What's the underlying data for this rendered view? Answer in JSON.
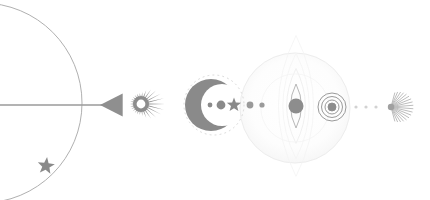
{
  "canvas": {
    "width": 430,
    "height": 200,
    "background": "#ffffff",
    "title": "Celestial Alignment Diagram",
    "baseline_y": 105
  },
  "palette": {
    "ink": "#8a8a8a",
    "ink_dark": "#7b7b7b",
    "ink_mid": "#9a9a9a",
    "ink_light": "#bdbdbd",
    "ink_faint": "#d8d8d8",
    "ink_ghost": "#ececec",
    "ink_whisper": "#f4f4f4",
    "background": "#ffffff"
  },
  "elements": [
    {
      "id": "orbit-arc",
      "name": "orbit-arc",
      "label": "Large orbital arc",
      "type": "circle-outline",
      "cx": -18,
      "cy": 103,
      "r": 100,
      "stroke": "#b0b0b0",
      "stroke_width": 1
    },
    {
      "id": "orbit-star",
      "name": "orbit-star",
      "label": "Star on orbit",
      "type": "star",
      "cx": 46,
      "cy": 166,
      "r": 9,
      "points": 5,
      "fill": "#8a8a8a"
    },
    {
      "id": "sight-line",
      "name": "sight-line",
      "label": "Horizontal sight line",
      "type": "line",
      "x1": 0,
      "y1": 105,
      "x2": 108,
      "y2": 105,
      "stroke": "#9a9a9a",
      "stroke_width": 1.6
    },
    {
      "id": "pointer-triangle",
      "name": "pointer-triangle",
      "label": "Left-pointing triangle marker",
      "type": "triangle",
      "cx": 114,
      "cy": 105,
      "size": 14,
      "direction": "left",
      "fill": "#8f8f8f"
    },
    {
      "id": "sunburst",
      "name": "sunburst-icon",
      "label": "Radiating sun",
      "type": "burst",
      "cx": 141,
      "cy": 104,
      "inner_r": 8,
      "hole_r": 4.4,
      "rays": 26,
      "ray_short": 11,
      "ray_long": 24,
      "fill": "#8d8d8d"
    },
    {
      "id": "crescent-halo",
      "name": "crescent-halo",
      "label": "Dotted halo around crescent",
      "type": "dotted-circle",
      "cx": 214,
      "cy": 105,
      "r": 30,
      "stroke": "#d8d8d8"
    },
    {
      "id": "crescent-moon",
      "name": "crescent-moon-icon",
      "label": "Crescent moon",
      "type": "crescent",
      "cx": 211,
      "cy": 105,
      "r": 26,
      "cut_cx": 222,
      "cut_r": 21,
      "fill": "#8a8a8a"
    },
    {
      "id": "dot-a",
      "name": "alignment-dot-small",
      "label": "Small alignment dot",
      "type": "dot",
      "cx": 210,
      "cy": 105,
      "r": 2.4,
      "fill": "#8a8a8a"
    },
    {
      "id": "dot-b",
      "name": "alignment-dot-large",
      "label": "Large alignment dot",
      "type": "dot",
      "cx": 221,
      "cy": 105,
      "r": 4.4,
      "fill": "#8a8a8a"
    },
    {
      "id": "mid-star",
      "name": "alignment-star",
      "label": "Small star between dots",
      "type": "star",
      "cx": 234,
      "cy": 105,
      "r": 7.5,
      "points": 5,
      "fill": "#8a8a8a"
    },
    {
      "id": "dot-c",
      "name": "alignment-dot-c",
      "label": "Alignment dot c",
      "type": "dot",
      "cx": 250,
      "cy": 105,
      "r": 3.4,
      "fill": "#9a9a9a"
    },
    {
      "id": "dot-d",
      "name": "alignment-dot-d",
      "label": "Alignment dot d",
      "type": "dot",
      "cx": 262,
      "cy": 105,
      "r": 2.6,
      "fill": "#9a9a9a"
    },
    {
      "id": "sphere",
      "name": "great-sphere",
      "label": "Large pale sphere",
      "type": "circle-outline",
      "cx": 295,
      "cy": 108,
      "r": 55,
      "stroke": "#ededed",
      "fill": "#fcfcfc",
      "stroke_width": 1
    },
    {
      "id": "eye",
      "name": "vesica-eye",
      "label": "Vesica eye with pupil",
      "type": "vesica",
      "cx": 296,
      "cy": 106,
      "half_height": 22,
      "half_width": 11,
      "pupil_r": 7.5,
      "stroke": "#b8b8b8",
      "pupil_fill": "#8d8d8d"
    },
    {
      "id": "rings",
      "name": "concentric-rings",
      "label": "Concentric target rings",
      "type": "rings",
      "cx": 332,
      "cy": 107,
      "radii": [
        14,
        10.5,
        7,
        4
      ],
      "core_r": 4,
      "stroke": "#9a9a9a",
      "core_fill": "#8d8d8d"
    },
    {
      "id": "trail",
      "name": "dotted-trail",
      "label": "Dotted trail to comet",
      "type": "dot-row",
      "cy": 107,
      "xs": [
        356,
        366,
        376
      ],
      "r": 1.6,
      "fill": "#d2d2d2"
    },
    {
      "id": "comet",
      "name": "comet-burst-icon",
      "label": "Comet burst",
      "type": "fan-burst",
      "cx": 391,
      "cy": 107,
      "core_r": 3.2,
      "rays": 18,
      "ray_len": 22,
      "spread_deg": 150,
      "fill": "#b5b5b5",
      "core_fill": "#a0a0a0"
    }
  ]
}
